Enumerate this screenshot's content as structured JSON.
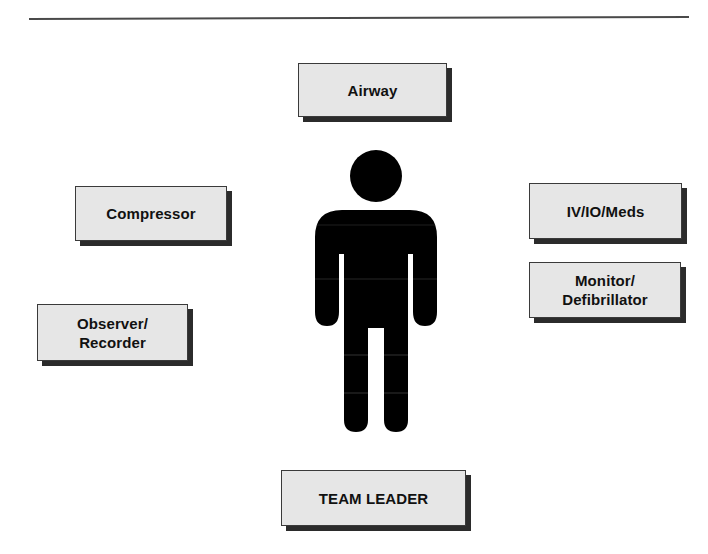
{
  "diagram": {
    "title_rule": true,
    "center_icon": "person-icon",
    "colors": {
      "box_fill": "#e6e6e6",
      "box_border": "#3a3a3a",
      "box_shadow": "#2b2b2b",
      "figure": "#000000",
      "text": "#111111",
      "rule": "#4a4a4a"
    },
    "roles": {
      "airway": "Airway",
      "compressor": "Compressor",
      "iv_io_meds": "IV/IO/Meds",
      "monitor_defibrillator": "Monitor/\nDefibrillator",
      "observer_recorder": "Observer/\nRecorder",
      "team_leader": "TEAM LEADER"
    }
  }
}
